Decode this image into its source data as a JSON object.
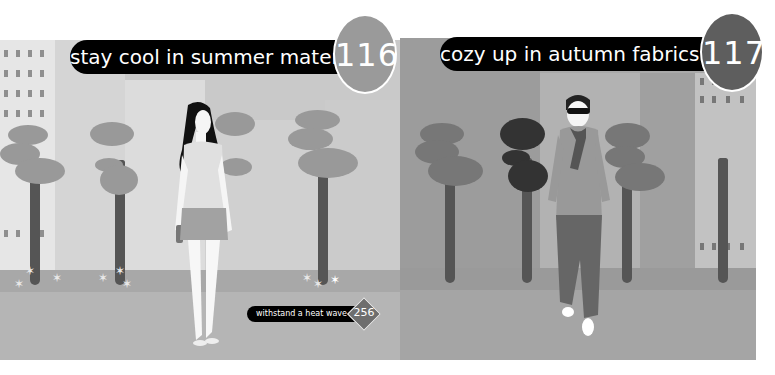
{
  "panels": [
    {
      "caption": "stay cool in summer material",
      "number": "116",
      "theme": "summer",
      "badge_color": "#9a9a9a"
    },
    {
      "caption": "cozy up in autumn fabrics",
      "number": "117",
      "theme": "autumn",
      "badge_color": "#5e5e5e"
    }
  ],
  "sub_caption": {
    "label": "withstand a heat wave",
    "number": "256"
  },
  "colors": {
    "caption_bg": "#000000",
    "summer_scene": "#c9c9c9",
    "autumn_scene": "#a9a9a9"
  }
}
